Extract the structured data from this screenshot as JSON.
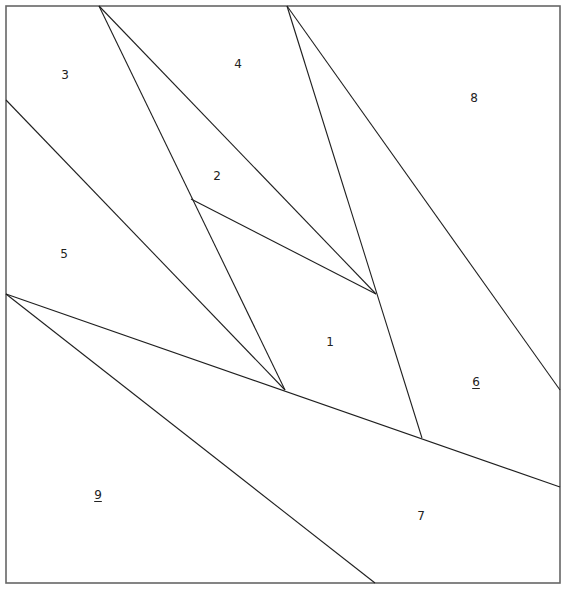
{
  "diagram": {
    "type": "paper-piecing-pattern",
    "frame": {
      "x1": 6,
      "y1": 6,
      "x2": 560,
      "y2": 583
    },
    "colors": {
      "frame": "#666666",
      "line": "#1f1f1f",
      "label": "#222222",
      "background": "#ffffff"
    },
    "vertices": {
      "A": [
        99,
        6
      ],
      "B": [
        287,
        6
      ],
      "L1": [
        6,
        100
      ],
      "L2": [
        6,
        294
      ],
      "R1": [
        560,
        390
      ],
      "R2": [
        560,
        487
      ],
      "BT": [
        375,
        583
      ],
      "P1": [
        376,
        294
      ],
      "P2": [
        191,
        199
      ],
      "P3": [
        285,
        390
      ],
      "P4": [
        422,
        438
      ]
    },
    "edges": [
      {
        "from": [
          99,
          6
        ],
        "to": [
          376,
          294
        ]
      },
      {
        "from": [
          99,
          6
        ],
        "to": [
          285,
          390
        ]
      },
      {
        "from": [
          287,
          6
        ],
        "to": [
          422,
          438
        ]
      },
      {
        "from": [
          287,
          6
        ],
        "to": [
          560,
          390
        ]
      },
      {
        "from": [
          191,
          199
        ],
        "to": [
          376,
          294
        ]
      },
      {
        "from": [
          6,
          100
        ],
        "to": [
          285,
          390
        ]
      },
      {
        "from": [
          6,
          294
        ],
        "to": [
          560,
          487
        ]
      },
      {
        "from": [
          6,
          294
        ],
        "to": [
          375,
          583
        ]
      }
    ],
    "pieces": [
      {
        "id": "1",
        "label": "1",
        "x": 330,
        "y": 342,
        "underlined": false
      },
      {
        "id": "2",
        "label": "2",
        "x": 217,
        "y": 176,
        "underlined": false
      },
      {
        "id": "3",
        "label": "3",
        "x": 65,
        "y": 75,
        "underlined": false
      },
      {
        "id": "4",
        "label": "4",
        "x": 238,
        "y": 64,
        "underlined": false
      },
      {
        "id": "5",
        "label": "5",
        "x": 64,
        "y": 254,
        "underlined": false
      },
      {
        "id": "6",
        "label": "6",
        "x": 476,
        "y": 382,
        "underlined": true
      },
      {
        "id": "7",
        "label": "7",
        "x": 421,
        "y": 516,
        "underlined": false
      },
      {
        "id": "8",
        "label": "8",
        "x": 474,
        "y": 98,
        "underlined": false
      },
      {
        "id": "9",
        "label": "9",
        "x": 98,
        "y": 495,
        "underlined": true
      }
    ]
  }
}
